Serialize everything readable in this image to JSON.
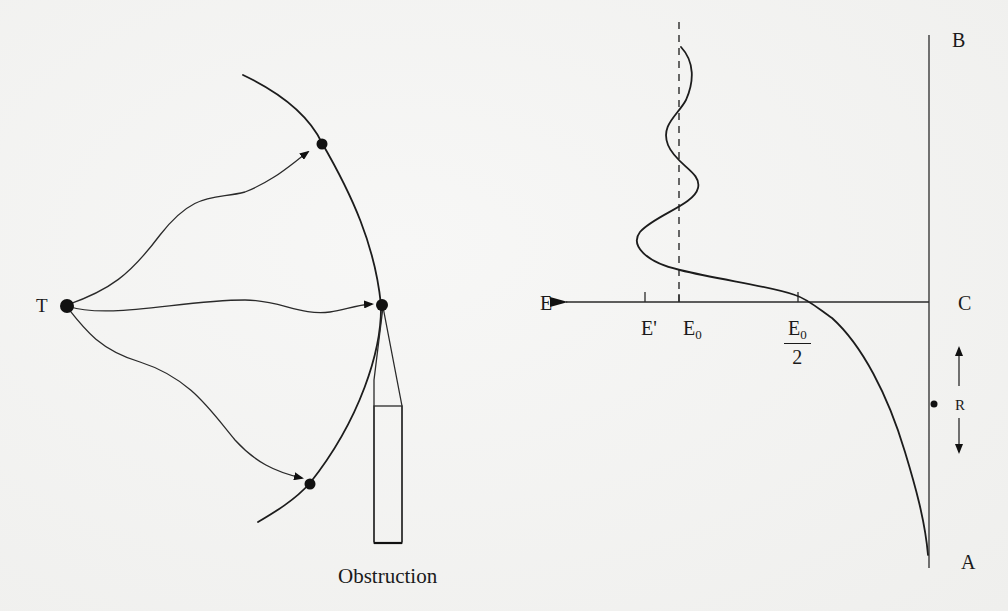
{
  "figure": {
    "left_panel": {
      "transmitter_label": "T",
      "obstruction_label": "Obstruction",
      "description": "Huygens wavefront diagram: rays from source T reach points on an arc-shaped wavefront; a vertical obstruction plate sits below the middle point"
    },
    "right_panel": {
      "axis_labels": {
        "top": "B",
        "middle": "C",
        "bottom": "A",
        "horizontal_arrow": "E"
      },
      "tick_labels": {
        "e_prime": "E'",
        "e_zero_main": "E",
        "e_zero_sub": "0",
        "e_half_num_main": "E",
        "e_half_num_sub": "0",
        "e_half_den": "2"
      },
      "distance_label": "R",
      "description": "Field strength E vs. height along line A–B; curve oscillates around E0 above C and falls toward zero below C, passing E0/2 at the shadow boundary"
    }
  }
}
